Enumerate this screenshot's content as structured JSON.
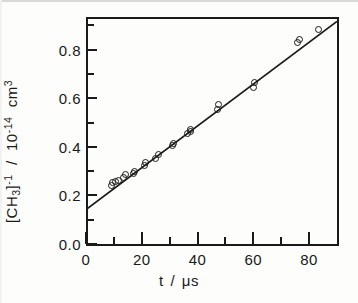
{
  "figure": {
    "background_color": "#fdfdfb",
    "ink_color": "#1a1a1a"
  },
  "axes": {
    "x": {
      "title_symbol": "t",
      "title_separator": "/",
      "title_unit": "μs",
      "title_full": "t / μs",
      "major_ticks": [
        "0",
        "20",
        "40",
        "60",
        "80"
      ],
      "major_tick_values": [
        0,
        20,
        40,
        60,
        80
      ],
      "minor_tick_values": [
        10,
        30,
        50,
        70
      ],
      "range": [
        0,
        90
      ]
    },
    "y": {
      "title_species": "CH",
      "title_species_sub": "3",
      "title_species_sup": "-1",
      "title_separator": "/",
      "title_scale_base": "10",
      "title_scale_exp": "-14",
      "title_unit": "cm",
      "title_unit_sup": "3",
      "title_full": "[CH3]-1 / 10-14 cm3",
      "major_ticks": [
        "0.0",
        "0.2",
        "0.4",
        "0.6",
        "0.8"
      ],
      "major_tick_values": [
        0.0,
        0.2,
        0.4,
        0.6,
        0.8
      ],
      "minor_tick_values": [
        0.1,
        0.3,
        0.5,
        0.7,
        0.9
      ],
      "range": [
        0.0,
        0.935
      ]
    }
  },
  "chart_data": {
    "type": "scatter",
    "title": "",
    "xlabel": "t / μs",
    "ylabel": "[CH3]^-1 / 10^-14 cm^3",
    "xlim": [
      0,
      90
    ],
    "ylim": [
      0.0,
      0.935
    ],
    "grid": false,
    "legend": "none",
    "marker_style": "open-circle",
    "x": [
      9.0,
      9.5,
      10.5,
      11.5,
      13.5,
      14.0,
      17.0,
      17.5,
      21.0,
      21.5,
      25.0,
      26.0,
      31.0,
      31.5,
      36.5,
      37.5,
      37.5,
      47.0,
      47.5,
      60.0,
      60.5,
      76.0,
      76.5,
      83.5
    ],
    "y": [
      0.243,
      0.252,
      0.258,
      0.262,
      0.272,
      0.285,
      0.289,
      0.297,
      0.322,
      0.336,
      0.352,
      0.368,
      0.405,
      0.414,
      0.455,
      0.462,
      0.47,
      0.556,
      0.575,
      0.645,
      0.665,
      0.828,
      0.843,
      0.885
    ],
    "fit_line": {
      "type": "linear",
      "intercept": 0.142,
      "slope": 0.00861,
      "x_start": 0,
      "x_end": 90,
      "y_start": 0.142,
      "y_end": 0.917
    }
  }
}
